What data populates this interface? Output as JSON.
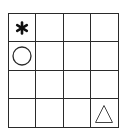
{
  "grid": {
    "rows": 4,
    "cols": 4,
    "line_color": "#2a2a2a",
    "cells": [
      [
        {
          "symbol": "asterisk"
        },
        {
          "symbol": ""
        },
        {
          "symbol": ""
        },
        {
          "symbol": ""
        }
      ],
      [
        {
          "symbol": "circle"
        },
        {
          "symbol": ""
        },
        {
          "symbol": ""
        },
        {
          "symbol": ""
        }
      ],
      [
        {
          "symbol": ""
        },
        {
          "symbol": ""
        },
        {
          "symbol": ""
        },
        {
          "symbol": ""
        }
      ],
      [
        {
          "symbol": ""
        },
        {
          "symbol": ""
        },
        {
          "symbol": ""
        },
        {
          "symbol": "triangle"
        }
      ]
    ]
  }
}
